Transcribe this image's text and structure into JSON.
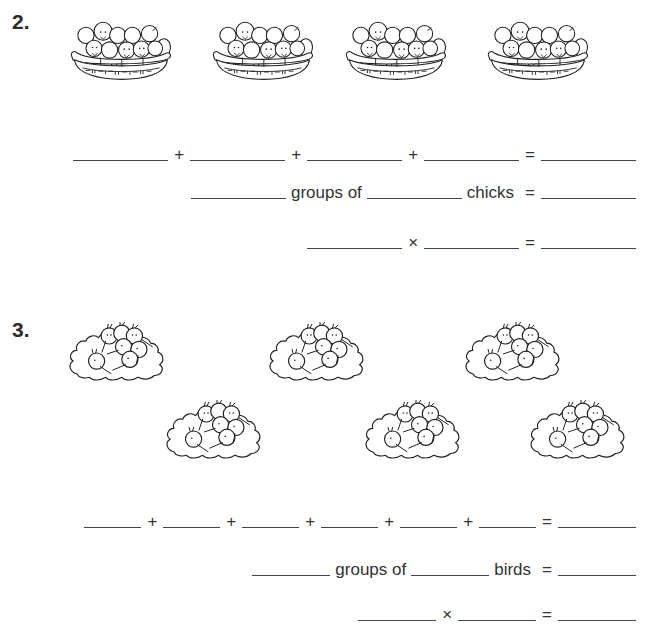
{
  "problems": [
    {
      "number": "2.",
      "picture": {
        "icon": "basket-of-chicks-icon",
        "group_count": 4
      },
      "addition_row": {
        "operator": "+",
        "equals": "=",
        "addend_blanks": 4
      },
      "groups_row": {
        "middle_text": "groups of",
        "unit_text": "chicks",
        "equals": "="
      },
      "multiplication_row": {
        "operator": "×",
        "equals": "="
      }
    },
    {
      "number": "3.",
      "picture": {
        "icon": "nest-of-kiwi-birds-icon",
        "group_count": 6
      },
      "addition_row": {
        "operator": "+",
        "equals": "=",
        "addend_blanks": 6
      },
      "groups_row": {
        "middle_text": "groups of",
        "unit_text": "birds",
        "equals": "="
      },
      "multiplication_row": {
        "operator": "×",
        "equals": "="
      }
    }
  ]
}
